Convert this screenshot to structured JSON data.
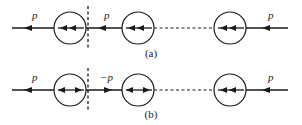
{
  "diagram": {
    "type": "momentum-transfer chain of particles",
    "panels": [
      {
        "id": "a",
        "caption": "(a)",
        "segment_labels": {
          "left_outer": "p",
          "between_1_2": "p",
          "right_outer": "p"
        },
        "segment_arrow_directions": {
          "left_outer": "left",
          "between_1_2": "left",
          "right_outer": "left"
        },
        "particles": [
          {
            "index": 1,
            "internal_arrows": "double-left"
          },
          {
            "index": 2,
            "internal_arrows": "double-left"
          },
          {
            "index": 3,
            "internal_arrows": "double-left"
          }
        ],
        "dashed_cut_after_particle": 1,
        "dashed_segment": "between_2_3"
      },
      {
        "id": "b",
        "caption": "(b)",
        "segment_labels": {
          "left_outer": "p",
          "between_1_2": "−p",
          "right_outer": "p"
        },
        "segment_arrow_directions": {
          "left_outer": "left",
          "between_1_2": "right",
          "right_outer": "left"
        },
        "particles": [
          {
            "index": 1,
            "internal_arrows": "double-outward"
          },
          {
            "index": 2,
            "internal_arrows": "double-outward"
          },
          {
            "index": 3,
            "internal_arrows": "double-left"
          }
        ],
        "dashed_cut_after_particle": 1,
        "dashed_segment": "between_2_3"
      }
    ],
    "colors": {
      "stroke": "#1a1a1a",
      "background": "#ffffff"
    }
  }
}
